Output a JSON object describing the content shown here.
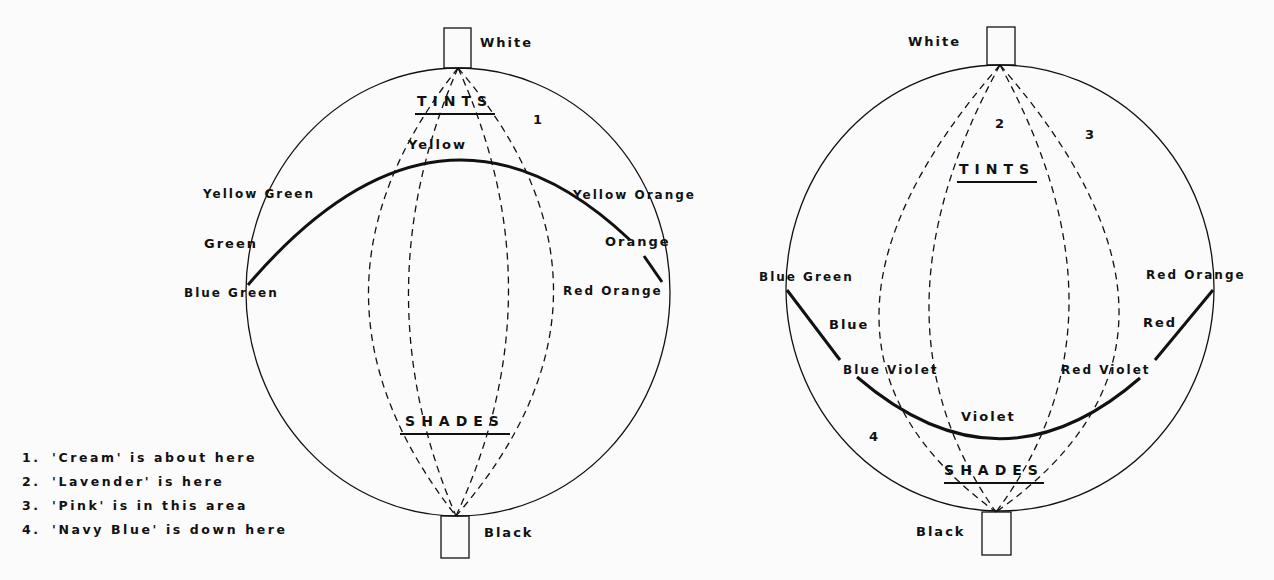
{
  "left_sphere": {
    "top_label": "White",
    "bottom_label": "Black",
    "tints_label": "TINTS",
    "shades_label": "SHADES",
    "marker_1": "1",
    "hues": {
      "yellow": "Yellow",
      "yellow_green": "Yellow Green",
      "yellow_orange": "Yellow Orange",
      "green": "Green",
      "orange": "Orange",
      "blue_green": "Blue Green",
      "red_orange": "Red Orange"
    }
  },
  "right_sphere": {
    "top_label": "White",
    "bottom_label": "Black",
    "tints_label": "TINTS",
    "shades_label": "SHADES",
    "marker_2": "2",
    "marker_3": "3",
    "marker_4": "4",
    "hues": {
      "blue_green": "Blue Green",
      "red_orange": "Red Orange",
      "blue": "Blue",
      "red": "Red",
      "blue_violet": "Blue Violet",
      "red_violet": "Red Violet",
      "violet": "Violet"
    }
  },
  "legend": [
    {
      "num": "1.",
      "text": "'Cream' is about here"
    },
    {
      "num": "2.",
      "text": "'Lavender' is here"
    },
    {
      "num": "3.",
      "text": "'Pink' is in this area"
    },
    {
      "num": "4.",
      "text": "'Navy Blue' is down here"
    }
  ],
  "colors": {
    "ink": "#111111",
    "background": "#fbfbfb"
  }
}
